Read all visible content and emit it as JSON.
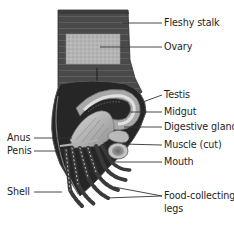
{
  "diagram": {
    "labels_right": [
      {
        "id": "fleshy-stalk",
        "text": "Fleshy stalk"
      },
      {
        "id": "ovary",
        "text": "Ovary"
      },
      {
        "id": "testis",
        "text": "Testis"
      },
      {
        "id": "midgut",
        "text": "Midgut"
      },
      {
        "id": "digestive-gland",
        "text": "Digestive gland"
      },
      {
        "id": "muscle-cut",
        "text": "Muscle (cut)"
      },
      {
        "id": "mouth",
        "text": "Mouth"
      },
      {
        "id": "food-collecting-legs-1",
        "text": "Food-collecting"
      },
      {
        "id": "food-collecting-legs-2",
        "text": "legs"
      }
    ],
    "labels_left": [
      {
        "id": "anus",
        "text": "Anus"
      },
      {
        "id": "penis",
        "text": "Penis"
      },
      {
        "id": "shell",
        "text": "Shell"
      }
    ],
    "colors": {
      "stalk": "#4a4a4a",
      "stalk_stripe": "#5c5c5c",
      "ovary": "#b8b8b8",
      "shell_dark": "#262626",
      "body_light": "#c8c8c8",
      "leader_line": "#333333",
      "text": "#1e1e1e"
    }
  }
}
